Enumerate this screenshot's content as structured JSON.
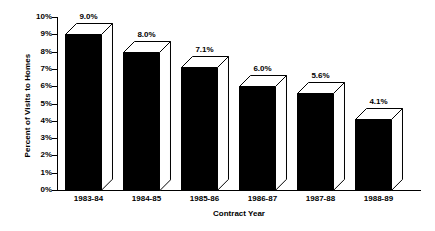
{
  "chart_data": {
    "type": "bar",
    "title": "",
    "subtitle": "",
    "xlabel": "Contract Year",
    "ylabel": "Percent of Visits to Homes",
    "categories": [
      "1983-84",
      "1984-85",
      "1985-86",
      "1986-87",
      "1987-88",
      "1988-89"
    ],
    "values": [
      9.0,
      8.0,
      7.1,
      6.0,
      5.6,
      4.1
    ],
    "data_labels": [
      "9.0%",
      "8.0%",
      "7.1%",
      "6.0%",
      "5.6%",
      "4.1%"
    ],
    "ylim": [
      0,
      10
    ],
    "ytick_values": [
      10,
      9,
      8,
      7,
      6,
      5,
      4,
      3,
      2,
      1,
      0
    ],
    "ytick_labels": [
      "10%",
      "9%",
      "8%",
      "7%",
      "6%",
      "5%",
      "4%",
      "3%",
      "2%",
      "1%",
      "0%"
    ],
    "grid": false,
    "legend": false,
    "legend_position": "none",
    "style": "3d-column",
    "colors": {
      "bar_front": "#000000",
      "bar_top": "#ffffff",
      "bar_side": "#ffffff",
      "outline": "#000000",
      "axis": "#000000",
      "background": "#ffffff",
      "text": "#000000"
    }
  }
}
